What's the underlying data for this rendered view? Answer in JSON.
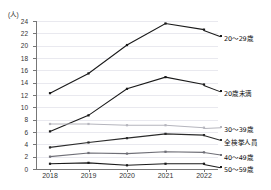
{
  "chart_data": {
    "type": "line",
    "title": "",
    "subtitle": "",
    "xlabel": "",
    "ylabel": "(人)",
    "y_unit_label": "(人)",
    "x": [
      "2018",
      "2019",
      "2020",
      "2021",
      "2022"
    ],
    "categories": [
      "2018",
      "2019",
      "2020",
      "2021",
      "2022"
    ],
    "ylim": [
      0,
      24
    ],
    "ytick_labels": [
      "0",
      "2",
      "4",
      "6",
      "8",
      "10",
      "12",
      "14",
      "16",
      "18",
      "20",
      "22",
      "24"
    ],
    "ytick_values": [
      0,
      2,
      4,
      6,
      8,
      10,
      12,
      14,
      16,
      18,
      20,
      22,
      24
    ],
    "grid": true,
    "grid_axis": "y",
    "legend_position": "right-inline-labels",
    "series": [
      {
        "name": "20～29歳",
        "label": "20～29歳",
        "color": "#1a1a1a",
        "values": [
          12.3,
          15.5,
          20.1,
          23.6,
          22.6
        ]
      },
      {
        "name": "20歳未満",
        "label": "20歳未満",
        "color": "#1a1a1a",
        "values": [
          6.1,
          8.7,
          13.0,
          14.9,
          13.7
        ]
      },
      {
        "name": "30～39歳",
        "label": "30～39歳",
        "color": "#b5b5bd",
        "values": [
          7.3,
          7.3,
          7.1,
          7.1,
          6.7
        ]
      },
      {
        "name": "全検挙人員",
        "label": "全検挙人員",
        "color": "#2b2b2b",
        "values": [
          3.5,
          4.3,
          5.0,
          5.7,
          5.5
        ]
      },
      {
        "name": "40～49歳",
        "label": "40～49歳",
        "color": "#6e6e76",
        "values": [
          2.0,
          2.6,
          2.5,
          2.8,
          2.7
        ]
      },
      {
        "name": "50～59歳",
        "label": "50～59歳",
        "color": "#1a1a1a",
        "values": [
          0.85,
          1.0,
          0.6,
          0.85,
          0.85
        ]
      }
    ]
  },
  "axis": {
    "y_unit": "(人)",
    "y_ticks": [
      "24",
      "22",
      "20",
      "18",
      "16",
      "14",
      "12",
      "10",
      "8",
      "6",
      "4",
      "2",
      "0"
    ],
    "x_ticks": [
      "2018",
      "2019",
      "2020",
      "2021",
      "2022"
    ]
  },
  "labels": {
    "s0": "20～29歳",
    "s1": "20歳未満",
    "s2": "30～39歳",
    "s3": "全検挙人員",
    "s4": "40～49歳",
    "s5": "50～59歳"
  }
}
